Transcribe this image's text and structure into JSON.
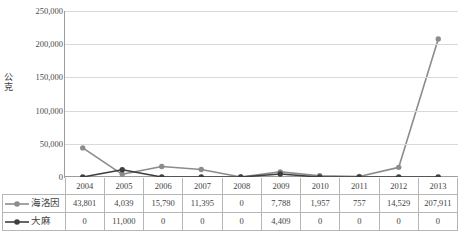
{
  "axis": {
    "y_label": "公克",
    "y_label_chars": [
      "公",
      "克"
    ],
    "y_ticks": [
      "250,000",
      "200,000",
      "150,000",
      "100,000",
      "50,000",
      "0"
    ]
  },
  "legend": [
    {
      "name": "海洛因",
      "color": "#8c8c8c",
      "marker": "circle"
    },
    {
      "name": "大麻",
      "color": "#3f3f3f",
      "marker": "circle"
    }
  ],
  "table": {
    "years": [
      "2004",
      "2005",
      "2006",
      "2007",
      "2008",
      "2009",
      "2010",
      "2011",
      "2012",
      "2013"
    ],
    "rows": [
      {
        "label": "海洛因",
        "values": [
          "43,801",
          "4,039",
          "15,790",
          "11,395",
          "0",
          "7,788",
          "1,957",
          "757",
          "14,529",
          "207,911"
        ]
      },
      {
        "label": "大麻",
        "values": [
          "0",
          "11,000",
          "0",
          "0",
          "0",
          "4,409",
          "0",
          "0",
          "0",
          "0"
        ]
      }
    ]
  },
  "chart_data": {
    "type": "line",
    "title": "",
    "xlabel": "",
    "ylabel": "公克",
    "categories": [
      "2004",
      "2005",
      "2006",
      "2007",
      "2008",
      "2009",
      "2010",
      "2011",
      "2012",
      "2013"
    ],
    "ylim": [
      0,
      250000
    ],
    "ytick_step": 50000,
    "grid": true,
    "legend_position": "table-left",
    "series": [
      {
        "name": "海洛因",
        "color": "#8c8c8c",
        "values": [
          43801,
          4039,
          15790,
          11395,
          0,
          7788,
          1957,
          757,
          14529,
          207911
        ]
      },
      {
        "name": "大麻",
        "color": "#3f3f3f",
        "values": [
          0,
          11000,
          0,
          0,
          0,
          4409,
          0,
          0,
          0,
          0
        ]
      }
    ]
  }
}
